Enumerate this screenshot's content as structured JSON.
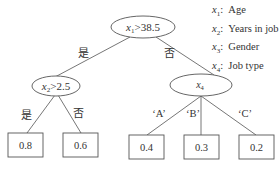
{
  "legend": [
    {
      "var": "x",
      "sub": "1",
      "sep": ":",
      "label": "Age"
    },
    {
      "var": "x",
      "sub": "2",
      "sep": ":",
      "label": "Years in job"
    },
    {
      "var": "x",
      "sub": "3",
      "sep": ":",
      "label": "Gender"
    },
    {
      "var": "x",
      "sub": "4",
      "sep": ":",
      "label": "Job type"
    }
  ],
  "tree": {
    "root": {
      "var": "x",
      "sub": "1",
      "op": ">",
      "value": "38.5"
    },
    "left_node": {
      "var": "x",
      "sub": "2",
      "op": ">",
      "value": "2.5"
    },
    "right_node": {
      "var": "x",
      "sub": "4"
    },
    "edges": {
      "root_yes": "是",
      "root_no": "否",
      "left_yes": "是",
      "left_no": "否",
      "right_a": "‘A’",
      "right_b": "‘B’",
      "right_c": "‘C’"
    },
    "leaves": [
      "0.8",
      "0.6",
      "0.4",
      "0.3",
      "0.2"
    ]
  },
  "colors": {
    "stroke": "#555555",
    "text": "#333333",
    "background": "#ffffff"
  }
}
